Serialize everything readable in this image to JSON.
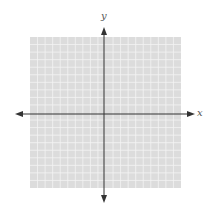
{
  "graph": {
    "x_label": "x",
    "y_label": "y",
    "grid_cells": 20,
    "grid_color": "#dcdcdc",
    "grid_line_color": "#f4f4f4",
    "axis_color": "#333333"
  }
}
